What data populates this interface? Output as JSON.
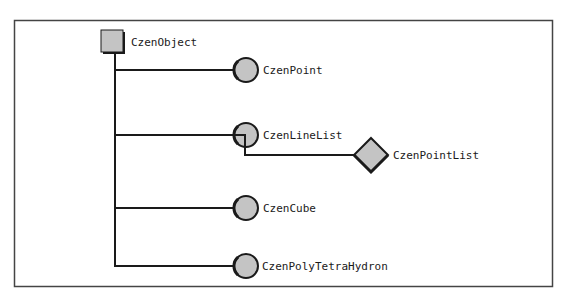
{
  "diagram": {
    "colors": {
      "fill": "#c4c4c4",
      "stroke": "#1a1a1a",
      "frame": "#444444"
    },
    "root": {
      "label": "CzenObject",
      "shape": "square"
    },
    "children": [
      {
        "label": "CzenPoint",
        "shape": "circle"
      },
      {
        "label": "CzenLineList",
        "shape": "circle"
      },
      {
        "label": "CzenCube",
        "shape": "circle"
      },
      {
        "label": "CzenPolyTetraHydron",
        "shape": "circle"
      }
    ],
    "grandchild": {
      "label": "CzenPointList",
      "shape": "diamond",
      "parent": "CzenLineList"
    }
  }
}
